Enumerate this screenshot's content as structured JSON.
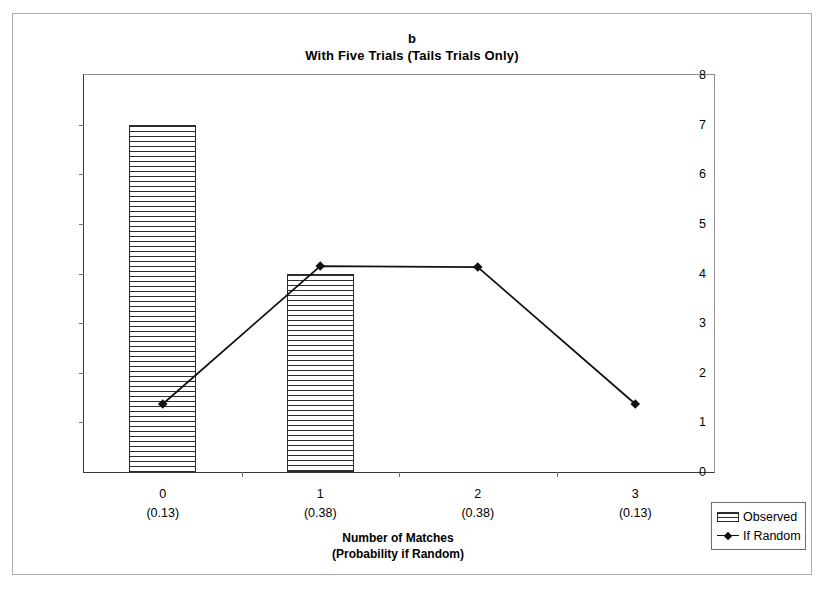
{
  "figure": {
    "panel_letter": "b",
    "title": "With Five Trials (Tails Trials Only)"
  },
  "axes": {
    "y_title": "Number of Principals",
    "x_title_line1": "Number of Matches",
    "x_title_line2": "(Probability if Random)"
  },
  "legend": {
    "observed": "Observed",
    "if_random": "If Random"
  },
  "chart_data": {
    "type": "bar",
    "title": "With Five Trials (Tails Trials Only)",
    "panel": "b",
    "xlabel": "Number of Matches (Probability if Random)",
    "ylabel": "Number of Principals",
    "ylim": [
      0,
      8
    ],
    "ytick_values": [
      0,
      1,
      2,
      3,
      4,
      5,
      6,
      7,
      8
    ],
    "ytick_labels": [
      "0",
      "1",
      "2",
      "3",
      "4",
      "5",
      "6",
      "7",
      "8"
    ],
    "grid": false,
    "legend_position": "bottom-right-outside",
    "categories": [
      "0",
      "1",
      "2",
      "3"
    ],
    "category_probabilities": [
      "(0.13)",
      "(0.38)",
      "(0.38)",
      "(0.13)"
    ],
    "series": [
      {
        "name": "Observed",
        "type": "bar",
        "values": [
          7,
          4,
          0,
          0
        ]
      },
      {
        "name": "If Random",
        "type": "line",
        "marker": "diamond",
        "values": [
          1.37,
          4.15,
          4.13,
          1.37
        ]
      }
    ]
  }
}
